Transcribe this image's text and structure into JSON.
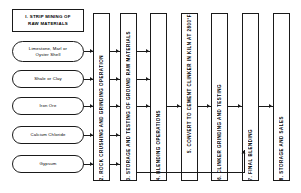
{
  "diagram": {
    "step1": {
      "label": "I. STRIP MINING OF\nRAW MATERIALS"
    },
    "raw_materials": [
      {
        "label": "Limestone, Marl or\nOyster Shell"
      },
      {
        "label": "Shale or Clay"
      },
      {
        "label": "Iron Ore"
      },
      {
        "label": "Calcium Chloride"
      },
      {
        "label": "Gypsum"
      }
    ],
    "process_steps": [
      {
        "label": "2. ROCK CRUSHING AND GRINDING OPERATION"
      },
      {
        "label": "3. STORAGE AND TESTING OF GROUND RAW MATERIALS"
      },
      {
        "label": "4. BLENDING OPERATIONS"
      },
      {
        "label": "5. CONVERT TO CEMENT CLINKER IN KILN AT 2800°F"
      },
      {
        "label": "6. CLINKER GRINDING AND TESTING"
      },
      {
        "label": "7. FINAL BLENDING"
      },
      {
        "label": "8. STORAGE AND SALES"
      }
    ],
    "colors": {
      "line": "#1a1a1a",
      "background": "#ffffff",
      "text": "#000000"
    }
  }
}
